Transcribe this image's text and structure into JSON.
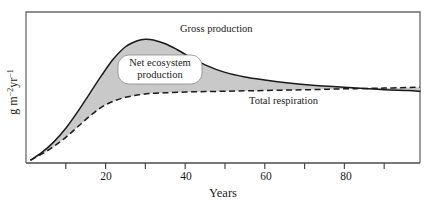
{
  "chart_data": {
    "type": "area",
    "title": "",
    "xlabel": "Years",
    "ylabel": "g m-2yr-1",
    "ylabel_parts": {
      "base1": "g m",
      "sup1": "-2",
      "base2": "yr",
      "sup2": "-1"
    },
    "xlim": [
      0,
      99
    ],
    "ylim": [
      0,
      100
    ],
    "grid": false,
    "legend": "inline-annotations",
    "x_ticks": [
      0,
      10,
      20,
      30,
      40,
      50,
      60,
      70,
      80,
      90
    ],
    "x_tick_labels": [
      "",
      "",
      "20",
      "",
      "40",
      "",
      "60",
      "",
      "80",
      ""
    ],
    "y_ticks": [],
    "y_tick_labels": [],
    "fill_between": {
      "label": "Net ecosystem production",
      "upper_series": "Gross production",
      "lower_series": "Total respiration",
      "color": "#c9c9c9"
    },
    "series": [
      {
        "name": "Gross production",
        "style": "solid",
        "color": "#1a1a1a",
        "x": [
          1.2,
          4,
          7,
          10,
          13,
          16,
          19,
          22,
          25,
          28,
          30,
          32,
          35,
          38,
          41,
          45,
          50,
          55,
          60,
          66,
          72,
          78,
          84,
          90,
          96,
          99
        ],
        "y": [
          2,
          7,
          14,
          23,
          34,
          46,
          58,
          69,
          77,
          81,
          82,
          81.5,
          79,
          75,
          70.5,
          65,
          60,
          57,
          55,
          53,
          51.5,
          50.5,
          49.5,
          48.5,
          48,
          47.5
        ]
      },
      {
        "name": "Total respiration",
        "style": "dashed",
        "color": "#1a1a1a",
        "x": [
          1.2,
          4,
          7,
          10,
          13,
          16,
          19,
          22,
          25,
          28,
          31,
          35,
          40,
          45,
          50,
          55,
          60,
          66,
          72,
          78,
          84,
          90,
          96,
          99
        ],
        "y": [
          2,
          6,
          11,
          17,
          24,
          31,
          37,
          41,
          43.5,
          45,
          46,
          46.5,
          47,
          47.3,
          47.5,
          47.8,
          48,
          48.3,
          48.6,
          49,
          49.3,
          49.6,
          50,
          50.2
        ]
      }
    ],
    "annotations": [
      {
        "name": "gross-production-label",
        "text": "Gross production",
        "x": 39,
        "y": 90
      },
      {
        "name": "net-ecosystem-production-label",
        "text": "Net ecosystem production",
        "line1": "Net ecosystem",
        "line2": "production",
        "x": 23,
        "y": 62
      },
      {
        "name": "total-respiration-label",
        "text": "Total respiration",
        "x": 62,
        "y": 35
      }
    ]
  },
  "axis": {
    "x_title": "Years",
    "tick_20": "20",
    "tick_40": "40",
    "tick_60": "60",
    "tick_80": "80"
  },
  "labels": {
    "gross_production": "Gross production",
    "net_ecosystem_line1": "Net ecosystem",
    "net_ecosystem_line2": "production",
    "total_respiration": "Total respiration",
    "y_base1": "g m",
    "y_sup1": "−2",
    "y_base2": "yr",
    "y_sup2": "−1"
  },
  "colors": {
    "fill": "#c9c9c9",
    "line": "#1a1a1a",
    "frame": "#545454",
    "background": "#ffffff",
    "label_box": "#ffffff"
  }
}
